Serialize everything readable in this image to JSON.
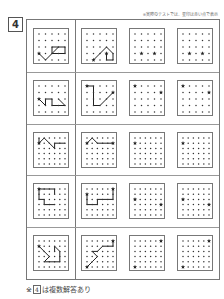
{
  "problem_number": "4",
  "caption": "※実際のテストでは、星印は赤い点で表示",
  "footnote": {
    "prefix": "※",
    "boxed": "4",
    "text": "は複数解答あり"
  },
  "grid": {
    "rows": 5,
    "columns": 4,
    "rows_spec": [
      {
        "dots": 5
      },
      {
        "dots": 5
      },
      {
        "dots": 6
      },
      {
        "dots": 6
      },
      {
        "dots": 6
      }
    ]
  },
  "panels": [
    [
      {
        "type": "pattern",
        "lines": [
          [
            0,
            3,
            1,
            4
          ],
          [
            1,
            4,
            2,
            3
          ],
          [
            2,
            3,
            2,
            2
          ],
          [
            2,
            2,
            3,
            2
          ],
          [
            3,
            2,
            2,
            3
          ],
          [
            2,
            3,
            4,
            3
          ],
          [
            4,
            3,
            4,
            2
          ],
          [
            4,
            2,
            3,
            2
          ]
        ],
        "stars": [
          [
            0,
            3
          ]
        ]
      },
      {
        "type": "pattern",
        "lines": [
          [
            1,
            4,
            3,
            2
          ],
          [
            3,
            2,
            4,
            3
          ],
          [
            4,
            3,
            4,
            4
          ],
          [
            4,
            4,
            3,
            4
          ],
          [
            3,
            4,
            3,
            3
          ]
        ],
        "stars": [
          [
            1,
            4
          ],
          [
            3,
            3
          ]
        ]
      },
      {
        "type": "blank",
        "stars": [
          [
            1,
            3
          ],
          [
            3,
            3
          ]
        ]
      },
      {
        "type": "blank",
        "stars": [
          [
            1,
            3
          ],
          [
            3,
            3
          ]
        ]
      }
    ],
    [
      {
        "type": "pattern",
        "lines": [
          [
            0,
            2,
            1,
            3
          ],
          [
            1,
            3,
            1,
            2
          ],
          [
            1,
            2,
            2,
            2
          ],
          [
            2,
            2,
            2,
            3
          ],
          [
            2,
            3,
            3,
            3
          ],
          [
            3,
            3,
            4,
            3
          ],
          [
            4,
            3,
            3,
            2
          ]
        ],
        "stars": [
          [
            0,
            2
          ]
        ]
      },
      {
        "type": "pattern",
        "lines": [
          [
            0,
            0,
            1,
            0
          ],
          [
            1,
            0,
            1,
            3
          ],
          [
            1,
            3,
            2,
            3
          ],
          [
            2,
            3,
            4,
            1
          ]
        ],
        "stars": [
          [
            0,
            0
          ],
          [
            4,
            1
          ]
        ]
      },
      {
        "type": "blank",
        "stars": [
          [
            0,
            0
          ],
          [
            4,
            1
          ]
        ]
      },
      {
        "type": "blank",
        "stars": [
          [
            0,
            0
          ],
          [
            4,
            1
          ]
        ]
      }
    ],
    [
      {
        "type": "pattern",
        "lines": [
          [
            0,
            1,
            1,
            0
          ],
          [
            1,
            0,
            2,
            1
          ],
          [
            2,
            1,
            3,
            2
          ],
          [
            3,
            2,
            3,
            1
          ],
          [
            3,
            1,
            5,
            1
          ],
          [
            0,
            1,
            0,
            0
          ]
        ],
        "stars": [
          [
            0,
            1
          ]
        ]
      },
      {
        "type": "pattern",
        "lines": [
          [
            0,
            1,
            1,
            0
          ],
          [
            1,
            0,
            2,
            1
          ],
          [
            2,
            1,
            5,
            1
          ]
        ],
        "stars": [
          [
            0,
            1
          ],
          [
            5,
            1
          ]
        ]
      },
      {
        "type": "blank",
        "stars": [
          [
            0,
            1
          ]
        ]
      },
      {
        "type": "blank",
        "stars": [
          [
            0,
            1
          ]
        ]
      }
    ],
    [
      {
        "type": "pattern",
        "lines": [
          [
            0,
            0,
            3,
            0
          ],
          [
            3,
            0,
            3,
            1
          ],
          [
            0,
            0,
            0,
            2
          ],
          [
            0,
            2,
            1,
            2
          ],
          [
            1,
            2,
            1,
            3
          ],
          [
            1,
            3,
            3,
            3
          ]
        ],
        "stars": [
          [
            0,
            0
          ]
        ]
      },
      {
        "type": "pattern",
        "lines": [
          [
            0,
            1,
            0,
            3
          ],
          [
            0,
            3,
            2,
            3
          ],
          [
            2,
            3,
            2,
            2
          ],
          [
            2,
            2,
            5,
            2
          ],
          [
            5,
            2,
            5,
            0
          ]
        ],
        "stars": [
          [
            0,
            1
          ],
          [
            5,
            0
          ]
        ]
      },
      {
        "type": "blank",
        "stars": [
          [
            0,
            2
          ],
          [
            5,
            3
          ]
        ]
      },
      {
        "type": "blank",
        "stars": [
          [
            0,
            2
          ],
          [
            5,
            3
          ]
        ]
      }
    ],
    [
      {
        "type": "pattern",
        "lines": [
          [
            0,
            1,
            1,
            2
          ],
          [
            1,
            2,
            2,
            3
          ],
          [
            2,
            3,
            1,
            4
          ],
          [
            1,
            4,
            4,
            4
          ],
          [
            4,
            4,
            4,
            2
          ],
          [
            4,
            2,
            3,
            1
          ],
          [
            3,
            1,
            3,
            2
          ]
        ],
        "stars": [
          [
            0,
            1
          ]
        ]
      },
      {
        "type": "pattern",
        "lines": [
          [
            0,
            5,
            1,
            4
          ],
          [
            1,
            4,
            2,
            3
          ],
          [
            2,
            3,
            1,
            2
          ],
          [
            1,
            2,
            2,
            2
          ],
          [
            2,
            2,
            3,
            1
          ],
          [
            3,
            1,
            5,
            1
          ],
          [
            5,
            1,
            5,
            0
          ]
        ],
        "stars": [
          [
            0,
            5
          ],
          [
            5,
            0
          ]
        ]
      },
      {
        "type": "blank",
        "stars": [
          [
            5,
            0
          ],
          [
            0,
            5
          ]
        ]
      },
      {
        "type": "blank",
        "stars": [
          [
            5,
            0
          ],
          [
            0,
            5
          ]
        ]
      }
    ]
  ],
  "colors": {
    "border": "#777777",
    "dot": "#333333",
    "line": "#222222",
    "star": "#222222"
  }
}
